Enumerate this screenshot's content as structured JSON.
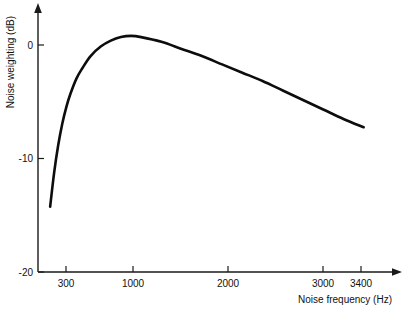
{
  "chart_data": {
    "type": "line",
    "title": "",
    "xlabel": "Noise frequency (Hz)",
    "ylabel": "Noise weighting (dB)",
    "xlim": [
      180,
      3700
    ],
    "ylim": [
      -20,
      2
    ],
    "xticks": [
      300,
      1000,
      2000,
      3000,
      3400
    ],
    "xtick_labels": [
      "300",
      "1000",
      "2000",
      "3000",
      "3400"
    ],
    "yticks": [
      0,
      -10,
      -20
    ],
    "ytick_labels": [
      "0",
      "-10",
      "-20"
    ],
    "grid": false,
    "legend": false,
    "series": [
      {
        "name": "Noise weighting",
        "x": [
          300,
          340,
          380,
          420,
          460,
          500,
          560,
          620,
          700,
          800,
          900,
          1000,
          1100,
          1200,
          1400,
          1600,
          1800,
          2000,
          2200,
          2400,
          2600,
          2800,
          3000,
          3200,
          3400
        ],
        "y": [
          -14.5,
          -11.6,
          -9.3,
          -7.5,
          -6.1,
          -5.0,
          -3.7,
          -2.8,
          -1.8,
          -1.0,
          -0.5,
          -0.2,
          -0.1,
          -0.2,
          -0.6,
          -1.2,
          -1.8,
          -2.5,
          -3.2,
          -3.9,
          -4.7,
          -5.5,
          -6.3,
          -7.1,
          -7.8
        ]
      }
    ]
  },
  "axes": {
    "y_axis_label": "Noise weighting (dB)",
    "x_axis_label": "Noise frequency (Hz)",
    "y_tick_0": "0",
    "y_tick_minus10": "-10",
    "y_tick_minus20": "-20",
    "x_tick_300": "300",
    "x_tick_1000": "1000",
    "x_tick_2000": "2000",
    "x_tick_3000": "3000",
    "x_tick_3400": "3400"
  },
  "style": {
    "curve_color": "#0d0d0d",
    "axis_color": "#1a1a1a",
    "text_color": "#111111",
    "background": "#ffffff"
  }
}
